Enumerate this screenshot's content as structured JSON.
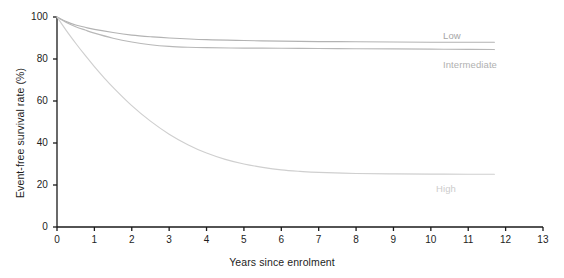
{
  "chart_data": {
    "type": "line",
    "title": "",
    "xlabel": "Years since enrolment",
    "ylabel": "Event-free survival rate (%)",
    "xlim": [
      0,
      13
    ],
    "ylim": [
      0,
      100
    ],
    "xticks": [
      "0",
      "1",
      "2",
      "3",
      "4",
      "5",
      "6",
      "7",
      "8",
      "9",
      "10",
      "11",
      "12",
      "13"
    ],
    "yticks": [
      "0",
      "20",
      "40",
      "60",
      "80",
      "100"
    ],
    "grid": false,
    "legend_position": "inline-right-of-curve-end",
    "series": [
      {
        "name": "Low",
        "color": "#b3b3b3",
        "label_color": "#a6a6a6",
        "x": [
          0,
          0.25,
          0.5,
          0.75,
          1,
          1.5,
          2,
          2.5,
          3,
          4,
          5,
          6,
          7,
          8,
          9,
          10,
          11,
          11.7
        ],
        "values": [
          100,
          97.8,
          96.2,
          95.1,
          94.1,
          92.6,
          91.4,
          90.6,
          90.0,
          89.2,
          88.8,
          88.5,
          88.3,
          88.2,
          88.1,
          88.0,
          88.0,
          88.0
        ]
      },
      {
        "name": "Intermediate",
        "color": "#b8b8b8",
        "label_color": "#b0b0b0",
        "x": [
          0,
          0.25,
          0.5,
          0.75,
          1,
          1.5,
          2,
          2.5,
          3,
          3.5,
          4,
          5,
          6,
          7,
          8,
          9,
          10,
          11,
          11.7
        ],
        "values": [
          100,
          97.4,
          95.4,
          93.8,
          92.3,
          89.9,
          88.1,
          86.8,
          86.0,
          85.6,
          85.4,
          85.2,
          85.1,
          85.0,
          84.9,
          84.8,
          84.7,
          84.6,
          84.5
        ]
      },
      {
        "name": "High",
        "color": "#cfcfcf",
        "label_color": "#cccccc",
        "x": [
          0,
          0.25,
          0.5,
          0.75,
          1,
          1.25,
          1.5,
          2,
          2.5,
          3,
          3.5,
          4,
          4.5,
          5,
          5.5,
          6,
          6.5,
          7,
          8,
          9,
          10,
          11,
          11.7
        ],
        "values": [
          100,
          93.5,
          87.5,
          81.8,
          76.4,
          71.3,
          66.5,
          57.8,
          50.4,
          44.2,
          39.2,
          35.2,
          32.2,
          30.0,
          28.4,
          27.2,
          26.5,
          26.0,
          25.5,
          25.3,
          25.2,
          25.1,
          25.1
        ]
      }
    ],
    "series_label_positions": [
      {
        "name": "Low",
        "x_px": 443,
        "y_px": 31
      },
      {
        "name": "Intermediate",
        "x_px": 443,
        "y_px": 60
      },
      {
        "name": "High",
        "x_px": 436,
        "y_px": 184
      }
    ],
    "axis_color": "#1a1a1a"
  },
  "geometry": {
    "x0_px": 57,
    "x1_px": 543,
    "y0_px": 227,
    "y1_px": 17
  }
}
